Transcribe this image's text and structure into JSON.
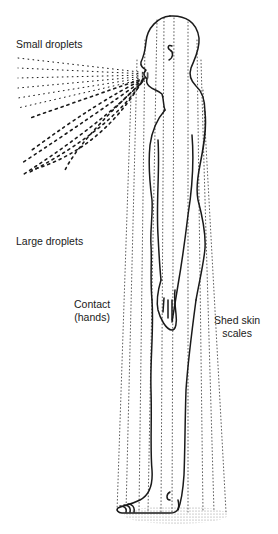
{
  "diagram": {
    "labels": {
      "small_droplets": "Small droplets",
      "large_droplets": "Large droplets",
      "contact_line1": "Contact",
      "contact_line2": "(hands)",
      "shed_line1": "Shed skin",
      "shed_line2": "scales"
    },
    "colors": {
      "ink": "#1a1a1a",
      "stipple": "#9a9a9a",
      "background": "#ffffff"
    }
  }
}
